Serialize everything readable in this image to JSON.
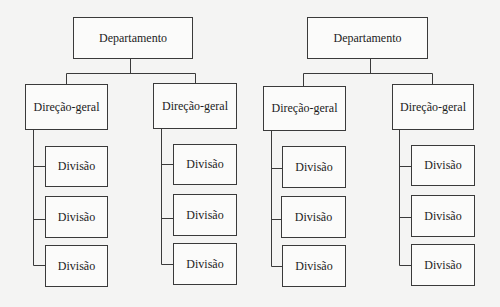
{
  "diagram": {
    "type": "org-chart",
    "colors": {
      "background": "#f4f4f3",
      "line": "#3a3a3a",
      "box_fill": "#fbfbfa",
      "text": "#1c1c1c"
    },
    "trees": [
      {
        "root": "Departamento",
        "branches": [
          {
            "label": "Direção-geral",
            "children": [
              "Divisão",
              "Divisão",
              "Divisão"
            ]
          },
          {
            "label": "Direção-geral",
            "children": [
              "Divisão",
              "Divisão",
              "Divisão"
            ]
          }
        ]
      },
      {
        "root": "Departamento",
        "branches": [
          {
            "label": "Direção-geral",
            "children": [
              "Divisão",
              "Divisão",
              "Divisão"
            ]
          },
          {
            "label": "Direção-geral",
            "children": [
              "Divisão",
              "Divisão",
              "Divisão"
            ]
          }
        ]
      }
    ]
  }
}
